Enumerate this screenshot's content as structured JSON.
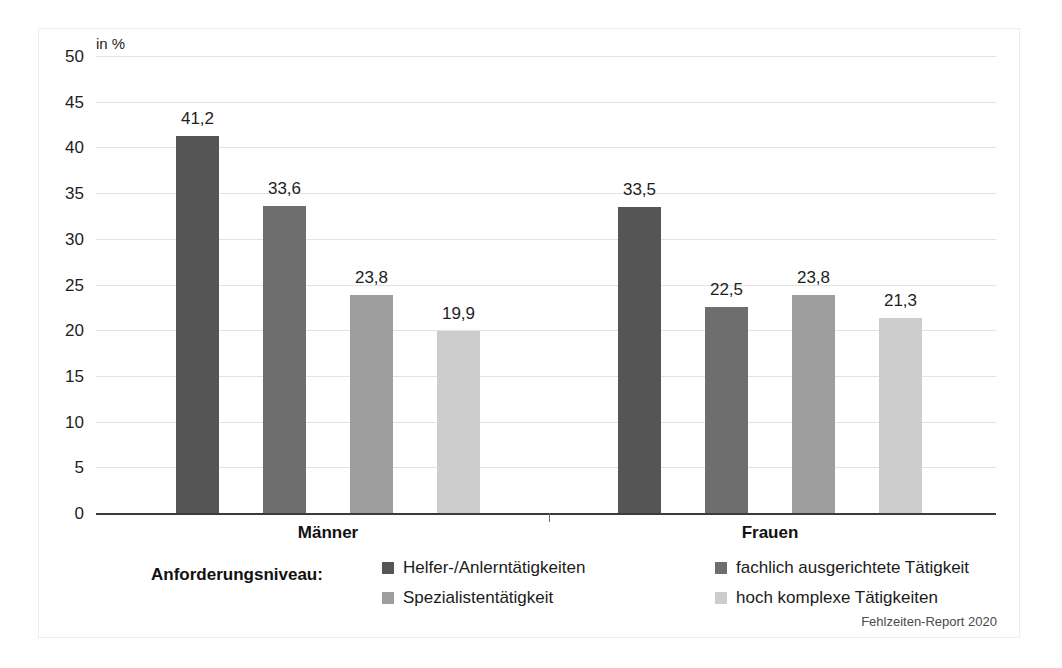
{
  "chart_data": {
    "type": "bar",
    "title": "",
    "subtitle": "",
    "unit_label": "in %",
    "xlabel": "",
    "ylabel": "",
    "ylim": [
      0,
      50
    ],
    "ytick_step": 5,
    "yticks": [
      "50",
      "45",
      "40",
      "35",
      "30",
      "25",
      "20",
      "15",
      "10",
      "5",
      "0"
    ],
    "grid": true,
    "legend_position": "bottom",
    "legend_title": "Anforderungsniveau:",
    "categories": [
      "Männer",
      "Frauen"
    ],
    "series": [
      {
        "name": "Helfer-/Anlerntätigkeiten",
        "color": "#555555",
        "values": [
          41.2,
          33.5
        ],
        "labels": [
          "41,2",
          "33,5"
        ]
      },
      {
        "name": "fachlich ausgerichtete Tätigkeit",
        "color": "#6e6e6e",
        "values": [
          33.6,
          22.5
        ],
        "labels": [
          "33,6",
          "22,5"
        ]
      },
      {
        "name": "Spezialistentätigkeit",
        "color": "#9e9e9e",
        "values": [
          23.8,
          23.8
        ],
        "labels": [
          "23,8",
          "23,8"
        ]
      },
      {
        "name": "hoch komplexe Tätigkeiten",
        "color": "#cdcdcd",
        "values": [
          19.9,
          21.3
        ],
        "labels": [
          "19,9",
          "21,3"
        ]
      }
    ],
    "source_note": "Fehlzeiten-Report 2020"
  },
  "legend": {
    "title": "Anforderungsniveau:",
    "items": [
      {
        "label": "Helfer-/Anlerntätigkeiten",
        "color": "#555555"
      },
      {
        "label": "fachlich ausgerichtete Tätigkeit",
        "color": "#6e6e6e"
      },
      {
        "label": "Spezialistentätigkeit",
        "color": "#9e9e9e"
      },
      {
        "label": "hoch komplexe Tätigkeiten",
        "color": "#cdcdcd"
      }
    ]
  },
  "axes": {
    "unit_label": "in %",
    "yticks": [
      "50",
      "45",
      "40",
      "35",
      "30",
      "25",
      "20",
      "15",
      "10",
      "5",
      "0"
    ],
    "group_labels": [
      "Männer",
      "Frauen"
    ]
  },
  "footer": {
    "source": "Fehlzeiten-Report 2020"
  }
}
